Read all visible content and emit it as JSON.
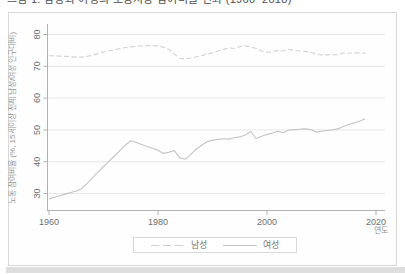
{
  "caption_clipped": "그림 1. 남성과 여성의 노동시장 참여비율 변화 (1960~2018)",
  "figure": {
    "xlabel": "연도",
    "ylabel": "노동 참여비율 (%, 15세이상 전체 남성/여성 인구대비)"
  },
  "colors": {
    "male_line": "#d2d2d2",
    "female_line": "#c4c4c4",
    "gridline": "#e7e7e7",
    "axis": "#b2b2b2",
    "tick_label": "#6e6e6e",
    "frame_border": "#d8d8d8",
    "page_strip": "#dedede"
  },
  "chart_data": {
    "type": "line",
    "title": "",
    "xlabel": "연도",
    "ylabel": "노동 참여비율 (%, 15세이상 전체 남성/여성 인구대비)",
    "grid": "horizontal",
    "legend_position": "bottom-center",
    "xlim": [
      1959,
      2022
    ],
    "ylim": [
      25,
      82
    ],
    "xticks": [
      1960,
      1980,
      2000,
      2020
    ],
    "yticks": [
      30,
      40,
      50,
      60,
      70,
      80
    ],
    "x": [
      1960,
      1961,
      1962,
      1963,
      1964,
      1965,
      1966,
      1967,
      1968,
      1969,
      1970,
      1971,
      1972,
      1973,
      1974,
      1975,
      1976,
      1977,
      1978,
      1979,
      1980,
      1981,
      1982,
      1983,
      1984,
      1985,
      1986,
      1987,
      1988,
      1989,
      1990,
      1991,
      1992,
      1993,
      1994,
      1995,
      1996,
      1997,
      1998,
      1999,
      2000,
      2001,
      2002,
      2003,
      2004,
      2005,
      2006,
      2007,
      2008,
      2009,
      2010,
      2011,
      2012,
      2013,
      2014,
      2015,
      2016,
      2017,
      2018
    ],
    "series": [
      {
        "name": "남성",
        "line_style": "dashed",
        "color": "#d2d2d2",
        "values": [
          73.3,
          73.3,
          73.2,
          73.1,
          73.0,
          72.9,
          72.9,
          73.1,
          73.5,
          74.0,
          74.5,
          74.9,
          75.2,
          75.6,
          75.9,
          76.1,
          76.3,
          76.4,
          76.5,
          76.5,
          76.4,
          76.0,
          75.3,
          73.8,
          72.5,
          72.3,
          72.6,
          73.0,
          73.4,
          73.8,
          74.2,
          74.8,
          75.3,
          75.8,
          75.6,
          76.2,
          76.4,
          76.1,
          75.6,
          74.8,
          74.4,
          74.6,
          75.0,
          74.8,
          75.3,
          75.0,
          74.8,
          74.7,
          74.4,
          73.9,
          73.6,
          73.6,
          73.7,
          73.6,
          74.2,
          74.1,
          74.2,
          74.2,
          74.1
        ]
      },
      {
        "name": "여성",
        "line_style": "solid",
        "color": "#c4c4c4",
        "values": [
          28.3,
          28.8,
          29.3,
          29.8,
          30.3,
          30.8,
          31.5,
          33.2,
          35.0,
          36.8,
          38.5,
          40.2,
          41.8,
          43.5,
          45.2,
          46.6,
          46.0,
          45.4,
          44.8,
          44.2,
          43.6,
          42.6,
          43.0,
          43.5,
          41.2,
          40.8,
          42.2,
          44.0,
          45.2,
          46.3,
          46.8,
          47.0,
          47.2,
          47.1,
          47.5,
          47.8,
          48.4,
          49.5,
          47.3,
          48.0,
          48.6,
          49.0,
          49.6,
          49.1,
          50.0,
          50.1,
          50.2,
          50.3,
          50.1,
          49.3,
          49.6,
          49.8,
          50.0,
          50.3,
          51.1,
          51.7,
          52.2,
          52.8,
          53.4
        ]
      }
    ]
  }
}
